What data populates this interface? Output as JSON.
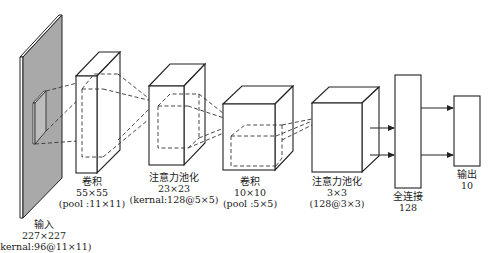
{
  "diagram": {
    "type": "cnn-architecture",
    "layers": [
      {
        "id": "input",
        "name": "输入",
        "size": "227×227",
        "detail": "(kernal:96@11×11)"
      },
      {
        "id": "conv1",
        "name": "卷积",
        "size": "55×55",
        "detail": "(pool :11×11)"
      },
      {
        "id": "attnpool1",
        "name": "注意力池化",
        "size": "23×23",
        "detail": "(kernal:128@5×5)"
      },
      {
        "id": "conv2",
        "name": "卷积",
        "size": "10×10",
        "detail": "(pool :5×5)"
      },
      {
        "id": "attnpool2",
        "name": "注意力池化",
        "size": "3×3",
        "detail": "(128@3×3)"
      },
      {
        "id": "fc",
        "name": "全连接",
        "size": "128",
        "detail": ""
      },
      {
        "id": "output",
        "name": "输出",
        "size": "10",
        "detail": ""
      }
    ],
    "colors": {
      "input_plane": "#a9a9a9",
      "stroke": "#222222",
      "background": "#ffffff"
    }
  }
}
